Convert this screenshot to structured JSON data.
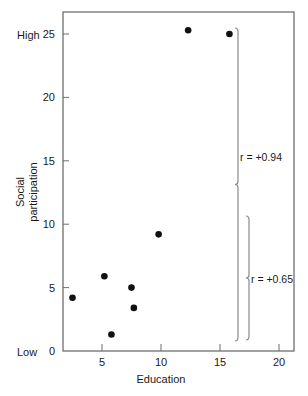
{
  "chart_data": {
    "type": "scatter",
    "title": "",
    "xlabel": "Education",
    "ylabel": "Social participation",
    "xlim": [
      0,
      21.3
    ],
    "ylim": [
      0,
      27
    ],
    "x_ticks": [
      5,
      10,
      15,
      20
    ],
    "y_ticks": [
      0,
      5,
      10,
      15,
      20,
      25
    ],
    "y_extreme_labels": {
      "high": "High",
      "low": "Low",
      "high_at": 25,
      "low_at": 0
    },
    "grid": false,
    "legend": null,
    "points": [
      {
        "x": 2.5,
        "y": 4.2
      },
      {
        "x": 5.2,
        "y": 5.9
      },
      {
        "x": 5.8,
        "y": 1.3
      },
      {
        "x": 7.5,
        "y": 5.0
      },
      {
        "x": 7.7,
        "y": 3.4
      },
      {
        "x": 9.8,
        "y": 9.2
      },
      {
        "x": 12.3,
        "y": 25.3
      },
      {
        "x": 15.8,
        "y": 25.0
      }
    ],
    "annotations": [
      {
        "label": "r = +0.94",
        "type": "bracket",
        "y_range": [
          0.8,
          25.5
        ],
        "x_position": 16.3
      },
      {
        "label": "r = +0.65",
        "type": "bracket",
        "y_range": [
          0.9,
          10.6
        ],
        "x_position": 17.2
      }
    ]
  },
  "labels": {
    "xlabel": "Education",
    "ylabel_line1": "Social",
    "ylabel_line2": "participation",
    "high": "High",
    "low": "Low",
    "r1": "r = +0.94",
    "r2": "r = +0.65"
  },
  "colors": {
    "axis": "#6f6f6f",
    "point": "#111111",
    "bracket": "#8a8a8a",
    "text": "#1a1a1a"
  }
}
